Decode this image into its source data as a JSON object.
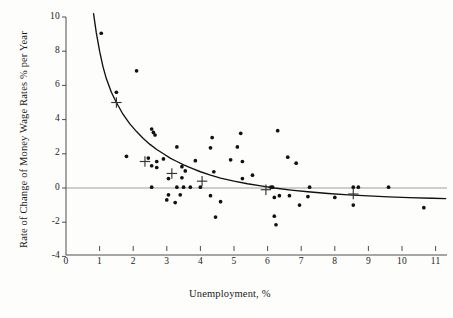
{
  "chart_data": {
    "type": "scatter",
    "title": "",
    "xlabel": "Unemployment, %",
    "ylabel": "Rate of Change of Money Wage Rates % per Year",
    "xlim": [
      0,
      11.3
    ],
    "ylim": [
      -4,
      10
    ],
    "xticks": [
      "0",
      "1",
      "2",
      "3",
      "4",
      "5",
      "6",
      "7",
      "8",
      "9",
      "10",
      "11"
    ],
    "xtick_values": [
      0,
      1,
      2,
      3,
      4,
      5,
      6,
      7,
      8,
      9,
      10,
      11
    ],
    "yticks": [
      "10",
      "8",
      "6",
      "4",
      "2",
      "0",
      "-2",
      "-4"
    ],
    "ytick_values": [
      10,
      8,
      6,
      4,
      2,
      0,
      -2,
      -4
    ],
    "grid": false,
    "legend": null,
    "zero_line": true,
    "series": [
      {
        "name": "observations",
        "marker": "dot",
        "color": "#111111",
        "points": [
          [
            1.05,
            9.05
          ],
          [
            2.1,
            6.85
          ],
          [
            1.5,
            5.6
          ],
          [
            2.55,
            3.45
          ],
          [
            2.6,
            3.25
          ],
          [
            2.65,
            3.1
          ],
          [
            4.35,
            2.95
          ],
          [
            5.2,
            3.2
          ],
          [
            6.3,
            3.35
          ],
          [
            1.8,
            1.85
          ],
          [
            3.3,
            2.4
          ],
          [
            4.3,
            2.35
          ],
          [
            5.1,
            2.4
          ],
          [
            2.45,
            1.75
          ],
          [
            2.7,
            1.55
          ],
          [
            2.9,
            1.7
          ],
          [
            3.85,
            1.6
          ],
          [
            4.9,
            1.65
          ],
          [
            5.25,
            1.55
          ],
          [
            6.6,
            1.8
          ],
          [
            6.85,
            1.45
          ],
          [
            2.55,
            1.3
          ],
          [
            2.7,
            1.2
          ],
          [
            3.45,
            1.25
          ],
          [
            3.55,
            1.0
          ],
          [
            4.4,
            0.95
          ],
          [
            5.55,
            0.75
          ],
          [
            3.05,
            0.55
          ],
          [
            3.45,
            0.6
          ],
          [
            5.25,
            0.55
          ],
          [
            2.55,
            0.05
          ],
          [
            3.3,
            0.05
          ],
          [
            3.5,
            0.05
          ],
          [
            3.7,
            0.05
          ],
          [
            4.0,
            0.05
          ],
          [
            6.1,
            0.05
          ],
          [
            6.15,
            0.05
          ],
          [
            7.25,
            0.05
          ],
          [
            8.55,
            0.05
          ],
          [
            8.7,
            0.05
          ],
          [
            9.6,
            0.05
          ],
          [
            3.05,
            -0.4
          ],
          [
            3.4,
            -0.4
          ],
          [
            4.3,
            -0.45
          ],
          [
            6.35,
            -0.45
          ],
          [
            6.65,
            -0.45
          ],
          [
            7.2,
            -0.5
          ],
          [
            8.0,
            -0.55
          ],
          [
            6.2,
            -0.55
          ],
          [
            3.0,
            -0.7
          ],
          [
            3.25,
            -0.85
          ],
          [
            4.6,
            -0.8
          ],
          [
            6.95,
            -1.0
          ],
          [
            8.55,
            -1.0
          ],
          [
            4.45,
            -1.7
          ],
          [
            6.2,
            -1.65
          ],
          [
            6.25,
            -2.15
          ],
          [
            10.65,
            -1.15
          ]
        ]
      },
      {
        "name": "group-averages",
        "marker": "cross",
        "color": "#333333",
        "points": [
          [
            1.5,
            5.0
          ],
          [
            2.35,
            1.55
          ],
          [
            3.15,
            0.85
          ],
          [
            4.05,
            0.4
          ],
          [
            5.95,
            -0.1
          ],
          [
            8.55,
            -0.35
          ]
        ]
      }
    ],
    "fitted_curve": {
      "name": "phillips-curve",
      "color": "#111111",
      "points": [
        [
          0.82,
          10.2
        ],
        [
          0.9,
          9.1
        ],
        [
          1.0,
          8.0
        ],
        [
          1.1,
          7.1
        ],
        [
          1.2,
          6.4
        ],
        [
          1.35,
          5.6
        ],
        [
          1.5,
          5.0
        ],
        [
          1.7,
          4.3
        ],
        [
          1.9,
          3.75
        ],
        [
          2.1,
          3.3
        ],
        [
          2.3,
          2.9
        ],
        [
          2.5,
          2.55
        ],
        [
          2.7,
          2.25
        ],
        [
          2.9,
          2.0
        ],
        [
          3.1,
          1.75
        ],
        [
          3.3,
          1.55
        ],
        [
          3.5,
          1.35
        ],
        [
          3.75,
          1.15
        ],
        [
          4.0,
          0.95
        ],
        [
          4.3,
          0.75
        ],
        [
          4.6,
          0.58
        ],
        [
          5.0,
          0.4
        ],
        [
          5.4,
          0.25
        ],
        [
          5.8,
          0.12
        ],
        [
          6.2,
          0.0
        ],
        [
          6.7,
          -0.12
        ],
        [
          7.2,
          -0.22
        ],
        [
          7.8,
          -0.32
        ],
        [
          8.4,
          -0.4
        ],
        [
          9.0,
          -0.46
        ],
        [
          9.6,
          -0.52
        ],
        [
          10.2,
          -0.56
        ],
        [
          10.9,
          -0.6
        ],
        [
          11.3,
          -0.62
        ]
      ]
    }
  }
}
